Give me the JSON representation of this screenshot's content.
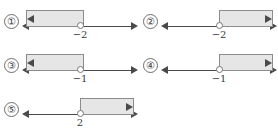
{
  "figure": {
    "kind": "number-line-inequality-options",
    "background_color": "#ffffff",
    "line_color": "#4a4a4a",
    "region_fill_color": "#e6e6e6",
    "region_border_color": "#8c8c8c",
    "open_dot_fill": "#ffffff",
    "open_dot_border": "#777777"
  },
  "options": [
    {
      "marker": "①",
      "boundary_label": "−2",
      "boundary_value": -2,
      "shaded_side": "left",
      "endpoint_type": "open",
      "left_arrow": true,
      "right_arrow": true
    },
    {
      "marker": "②",
      "boundary_label": "−2",
      "boundary_value": -2,
      "shaded_side": "right",
      "endpoint_type": "open",
      "left_arrow": true,
      "right_arrow": true
    },
    {
      "marker": "③",
      "boundary_label": "−1",
      "boundary_value": -1,
      "shaded_side": "left",
      "endpoint_type": "open",
      "left_arrow": true,
      "right_arrow": true
    },
    {
      "marker": "④",
      "boundary_label": "−1",
      "boundary_value": -1,
      "shaded_side": "right",
      "endpoint_type": "open",
      "left_arrow": true,
      "right_arrow": true
    },
    {
      "marker": "⑤",
      "boundary_label": "2",
      "boundary_value": 2,
      "shaded_side": "right",
      "endpoint_type": "open",
      "left_arrow": true,
      "right_arrow": true
    }
  ]
}
